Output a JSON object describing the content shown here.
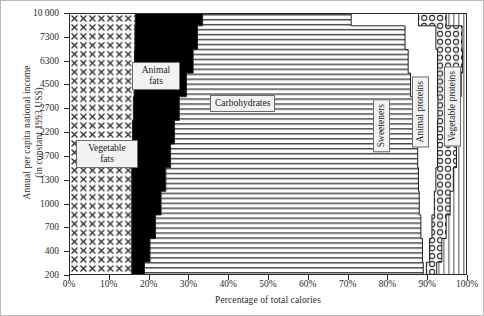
{
  "chart_data": {
    "type": "area",
    "title": "",
    "xlabel": "Percentage of total calories",
    "ylabel": "Annual per capita national income\n(in constant 1993 US$)",
    "xlim": [
      0,
      100
    ],
    "ylim": [
      0,
      11
    ],
    "grid": false,
    "legend": "inline-labels",
    "xticks": [
      "0%",
      "10%",
      "20%",
      "30%",
      "40%",
      "50%",
      "60%",
      "70%",
      "80%",
      "90%",
      "100%"
    ],
    "xtick_values": [
      0,
      10,
      20,
      30,
      40,
      50,
      60,
      70,
      80,
      90,
      100
    ],
    "yticks": [
      "200",
      "400",
      "700",
      "1000",
      "1300",
      "1700",
      "2200",
      "2700",
      "4500",
      "6300",
      "7300",
      "10 000"
    ],
    "ytick_index": [
      0,
      1,
      2,
      3,
      4,
      5,
      6,
      7,
      8,
      9,
      10,
      11
    ],
    "income_categories": [
      "200",
      "400",
      "700",
      "1000",
      "1300",
      "1700",
      "2200",
      "2700",
      "4500",
      "6300",
      "7300",
      "10 000"
    ],
    "series": [
      {
        "name": "Vegetable fats",
        "fill": "cross-hatch",
        "values": [
          15.6,
          15.6,
          15.6,
          15.6,
          15.6,
          15.8,
          15.8,
          16.0,
          16.2,
          16.3,
          16.4,
          16.5
        ]
      },
      {
        "name": "Animal fats",
        "fill": "solid-black",
        "values": [
          3.2,
          4.6,
          6.0,
          7.4,
          8.6,
          9.6,
          10.6,
          11.6,
          13.2,
          14.8,
          15.8,
          17.0
        ]
      },
      {
        "name": "Carbohydrates",
        "fill": "horizontal-lines",
        "values": [
          70.4,
          68.8,
          67.0,
          65.2,
          63.8,
          62.4,
          60.8,
          59.2,
          56.6,
          54.3,
          52.4,
          37.5
        ]
      },
      {
        "name": "Sweeteners",
        "fill": "white",
        "values": [
          0.8,
          1.8,
          2.8,
          3.8,
          4.4,
          5.0,
          5.6,
          6.1,
          6.8,
          7.4,
          7.8,
          17.0
        ]
      },
      {
        "name": "Animal proteins",
        "fill": "circles",
        "values": [
          2.6,
          3.1,
          3.6,
          4.0,
          4.4,
          4.8,
          5.2,
          5.5,
          6.0,
          6.3,
          6.6,
          7.0
        ]
      },
      {
        "name": "Vegetable proteins",
        "fill": "vertical-lines",
        "values": [
          7.4,
          6.1,
          5.0,
          4.0,
          3.5,
          3.0,
          2.6,
          2.4,
          2.0,
          1.7,
          1.6,
          5.0
        ]
      }
    ],
    "band_labels": [
      {
        "text": "Vegetable\nfats",
        "orientation": "horizontal"
      },
      {
        "text": "Animal\nfats",
        "orientation": "horizontal"
      },
      {
        "text": "Carbohydrates",
        "orientation": "horizontal"
      },
      {
        "text": "Sweeteners",
        "orientation": "vertical"
      },
      {
        "text": "Animal proteins",
        "orientation": "vertical"
      },
      {
        "text": "Vegetable proteins",
        "orientation": "vertical"
      }
    ],
    "colors": {
      "axis": "#2b2b2b",
      "text": "#2b2b2b",
      "animal_fats": "#000000",
      "label_box_bg": "#f2f2f2",
      "label_box_border": "#6b6b6b",
      "frame": "#b9b9b9"
    }
  }
}
